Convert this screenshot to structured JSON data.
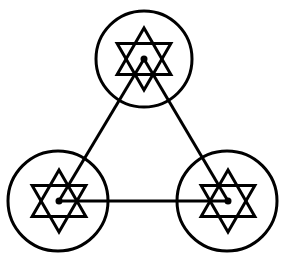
{
  "diagram": {
    "title": "",
    "width": 284,
    "height": 258,
    "background": "#ffffff",
    "stroke_color": "#000000",
    "stroke_width": 3,
    "nodes": [
      {
        "id": "top",
        "label": "",
        "circle": {
          "cx": 144,
          "cy": 59,
          "r": 48
        },
        "hexagram": {
          "cx": 144,
          "cy": 59,
          "r": 31
        },
        "dot": {
          "cx": 144,
          "cy": 59,
          "r": 3.5
        }
      },
      {
        "id": "bottom-left",
        "label": "",
        "circle": {
          "cx": 58,
          "cy": 201,
          "r": 50
        },
        "hexagram": {
          "cx": 59,
          "cy": 201,
          "r": 31
        },
        "dot": {
          "cx": 59,
          "cy": 201,
          "r": 3.5
        }
      },
      {
        "id": "bottom-right",
        "label": "",
        "circle": {
          "cx": 227,
          "cy": 201,
          "r": 50
        },
        "hexagram": {
          "cx": 228,
          "cy": 201,
          "r": 31
        },
        "dot": {
          "cx": 228,
          "cy": 201,
          "r": 3.5
        }
      }
    ],
    "edges": [
      {
        "from": "top",
        "to": "bottom-left"
      },
      {
        "from": "top",
        "to": "bottom-right"
      },
      {
        "from": "bottom-left",
        "to": "bottom-right"
      }
    ]
  }
}
